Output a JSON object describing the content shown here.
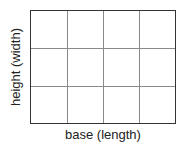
{
  "diagram": {
    "type": "rectangle-grid",
    "columns": 4,
    "rows": 3,
    "x_label": "base (length)",
    "y_label": "height (width)",
    "colors": {
      "border": "#333333",
      "grid_lines": "#8a8a8a",
      "background": "#ffffff"
    }
  }
}
